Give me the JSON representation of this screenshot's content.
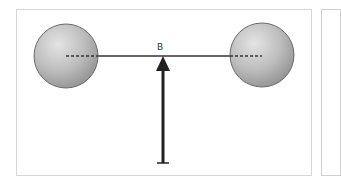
{
  "diagram": {
    "title": "",
    "point_label": "B",
    "elements": {
      "left_ball": {
        "cx": 66,
        "cy": 56,
        "r": 32
      },
      "right_ball": {
        "cx": 262,
        "cy": 55,
        "r": 32
      },
      "rod": {
        "x1": 66,
        "x2": 262,
        "y": 56
      },
      "support_arrow": {
        "x": 163,
        "tip_y": 57,
        "base_y": 163,
        "direction": "up"
      }
    },
    "colors": {
      "ball_light": "#dcdcdc",
      "ball_dark": "#9a9a9a",
      "ball_stroke": "#666666",
      "rod": "#333333",
      "arrow": "#222222",
      "frame": "#d6d6d6"
    }
  }
}
